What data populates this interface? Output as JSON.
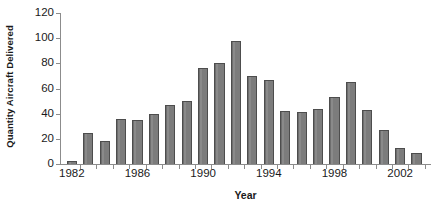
{
  "chart_data": {
    "type": "bar",
    "title": "",
    "xlabel": "Year",
    "ylabel": "Quantity Aircraft Delivered",
    "categories": [
      "1982",
      "1983",
      "1984",
      "1985",
      "1986",
      "1987",
      "1988",
      "1989",
      "1990",
      "1991",
      "1992",
      "1993",
      "1994",
      "1995",
      "1996",
      "1997",
      "1998",
      "1999",
      "2000",
      "2001",
      "2002",
      "2003"
    ],
    "values": [
      2,
      25,
      18,
      36,
      35,
      40,
      47,
      50,
      76,
      80,
      98,
      70,
      67,
      42,
      41,
      44,
      53,
      65,
      43,
      27,
      13,
      9
    ],
    "ylim": [
      0,
      120
    ],
    "yticks": [
      0,
      20,
      40,
      60,
      80,
      100,
      120
    ],
    "ytick_labels": [
      "0",
      "20",
      "40",
      "60",
      "80",
      "100",
      "120"
    ],
    "xtick_labels": [
      "1982",
      "1986",
      "1990",
      "1994",
      "1998",
      "2002"
    ],
    "xtick_categories": [
      "1982",
      "1986",
      "1990",
      "1994",
      "1998",
      "2002"
    ],
    "grid": false,
    "legend": "none",
    "bar_color": "#7c7c7c",
    "bar_edge_color": "#4d4d4d",
    "axis_color": "#8c8c8c",
    "text_color": "#1a1a1a",
    "background_color": "#ffffff"
  }
}
